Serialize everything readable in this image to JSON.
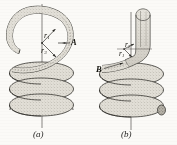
{
  "figure": {
    "background_color": "#fbfaf7",
    "ink_color": "#1d1c1a",
    "fill_color": "#d9d6cf",
    "panels": [
      {
        "id": "a",
        "caption": "(a)",
        "description": "Helical compression spring with a C-shaped (hook) end turn at the top; centre axis shown as a vertical line.",
        "point_labels": [
          {
            "name": "A",
            "text": "A",
            "meaning": "critical point on the outside of the hook bend"
          }
        ],
        "radius_labels": [
          {
            "name": "r1",
            "symbol": "r",
            "subscript": "1",
            "text": "r1"
          },
          {
            "name": "r3",
            "symbol": "r",
            "subscript": "3",
            "text": "r3"
          }
        ],
        "coil_count": 3
      },
      {
        "id": "b",
        "caption": "(b)",
        "description": "Helical compression spring with a straight vertical tube end bent over into the coil; centre axis shown as a vertical line and a free end cap at the lower right.",
        "point_labels": [
          {
            "name": "B",
            "text": "B",
            "meaning": "critical point at the inside of the bend where the end joins the body coils"
          }
        ],
        "radius_labels": [
          {
            "name": "r2",
            "symbol": "r",
            "subscript": "2",
            "text": "r2"
          },
          {
            "name": "r1",
            "symbol": "r",
            "subscript": "1",
            "text": "r1"
          }
        ],
        "coil_count": 3
      }
    ]
  }
}
